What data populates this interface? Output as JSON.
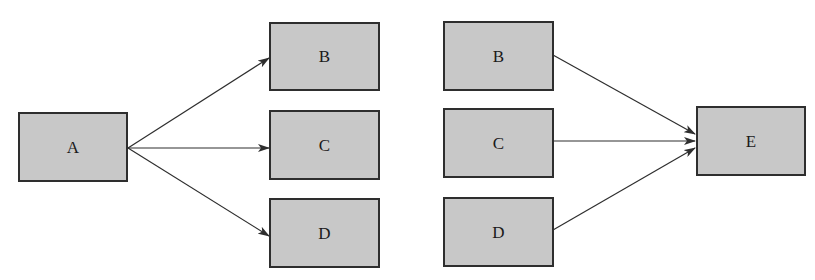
{
  "diagram": {
    "left_group": {
      "source": {
        "id": "A",
        "label": "A"
      },
      "targets": [
        {
          "id": "B",
          "label": "B"
        },
        {
          "id": "C",
          "label": "C"
        },
        {
          "id": "D",
          "label": "D"
        }
      ]
    },
    "right_group": {
      "sources": [
        {
          "id": "B",
          "label": "B"
        },
        {
          "id": "C",
          "label": "C"
        },
        {
          "id": "D",
          "label": "D"
        }
      ],
      "target": {
        "id": "E",
        "label": "E"
      }
    },
    "edges": [
      {
        "from": "A",
        "to": "B",
        "group": "left"
      },
      {
        "from": "A",
        "to": "C",
        "group": "left"
      },
      {
        "from": "A",
        "to": "D",
        "group": "left"
      },
      {
        "from": "B",
        "to": "E",
        "group": "right"
      },
      {
        "from": "C",
        "to": "E",
        "group": "right"
      },
      {
        "from": "D",
        "to": "E",
        "group": "right"
      }
    ],
    "colors": {
      "node_fill": "#c8c8c8",
      "node_border": "#2e2e2e",
      "edge": "#2e2e2e"
    }
  }
}
